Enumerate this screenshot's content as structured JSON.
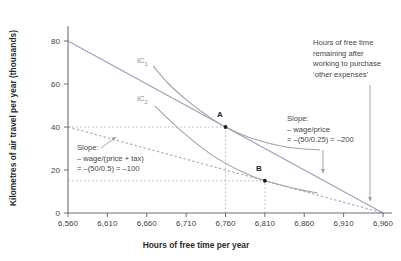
{
  "chart_data": {
    "type": "line",
    "title": "",
    "xlabel": "Hours of free time per year",
    "ylabel": "Kilometres of air travel per year (thousands)",
    "xlim": [
      6560,
      6960
    ],
    "ylim": [
      0,
      80
    ],
    "grid": false,
    "legend": "none",
    "x_ticks": [
      {
        "v": 6560,
        "label": "6,560"
      },
      {
        "v": 6610,
        "label": "6,610"
      },
      {
        "v": 6660,
        "label": "6,660"
      },
      {
        "v": 6710,
        "label": "6,710"
      },
      {
        "v": 6760,
        "label": "6,760"
      },
      {
        "v": 6810,
        "label": "6,810"
      },
      {
        "v": 6860,
        "label": "6,860"
      },
      {
        "v": 6910,
        "label": "6,910"
      },
      {
        "v": 6960,
        "label": "6,960"
      }
    ],
    "y_ticks": [
      {
        "v": 0,
        "label": "0"
      },
      {
        "v": 20,
        "label": "20"
      },
      {
        "v": 40,
        "label": "40"
      },
      {
        "v": 60,
        "label": "60"
      },
      {
        "v": 80,
        "label": "80"
      }
    ],
    "series": [
      {
        "id": "budget-line",
        "style": "solid",
        "color_key": "budget",
        "points": [
          [
            6560,
            80
          ],
          [
            6960,
            0
          ]
        ]
      },
      {
        "id": "budget-line-tax",
        "style": "dashed",
        "color_key": "budget_dashed",
        "points": [
          [
            6560,
            40
          ],
          [
            6960,
            0
          ]
        ]
      },
      {
        "id": "ic1",
        "label": "IC",
        "sub": "1",
        "style": "solid",
        "color_key": "ic",
        "points": [
          [
            6668,
            68.4
          ],
          [
            6688,
            60
          ],
          [
            6711,
            52.4
          ],
          [
            6735,
            45.8
          ],
          [
            6760,
            40
          ],
          [
            6796,
            34.4
          ],
          [
            6837,
            30.7
          ],
          [
            6880,
            29.3
          ]
        ]
      },
      {
        "id": "ic2",
        "label": "IC",
        "sub": "2",
        "style": "solid",
        "color_key": "ic",
        "points": [
          [
            6670,
            49.8
          ],
          [
            6708,
            36.9
          ],
          [
            6744,
            26.7
          ],
          [
            6779,
            19.5
          ],
          [
            6810,
            15
          ],
          [
            6853,
            11
          ],
          [
            6877,
            9.3
          ]
        ]
      }
    ],
    "points": [
      {
        "label": "A",
        "x": 6760,
        "y": 40
      },
      {
        "label": "B",
        "x": 6810,
        "y": 15
      }
    ],
    "guides": [
      {
        "points": [
          [
            6560,
            40
          ],
          [
            6760,
            40
          ]
        ]
      },
      {
        "points": [
          [
            6760,
            0
          ],
          [
            6760,
            40
          ]
        ]
      },
      {
        "points": [
          [
            6560,
            15
          ],
          [
            6810,
            15
          ]
        ]
      },
      {
        "points": [
          [
            6810,
            0
          ],
          [
            6810,
            15
          ]
        ]
      }
    ],
    "annotations": {
      "free_time": {
        "lines": [
          "Hours of free time",
          "remaining after",
          "working to purchase",
          "‘other expenses’"
        ]
      },
      "slope_original": {
        "lines": [
          "Slope:",
          "– wage/price",
          "= –(50/0.25) = –200"
        ]
      },
      "slope_tax": {
        "lines": [
          "Slope:",
          "– wage/(price + tax)",
          "= –(50/0.5) = –100"
        ]
      }
    },
    "colors": {
      "budget": "#a59cc3",
      "budget_dashed": "#b2abca",
      "ic": "#a3a3a3",
      "guide": "#b8b2cc",
      "axis": "#6e6e6e",
      "text": "#414141",
      "title": "#2b2b2b",
      "arrow": "#9a9a9a",
      "point": "#1c1c1c"
    }
  }
}
